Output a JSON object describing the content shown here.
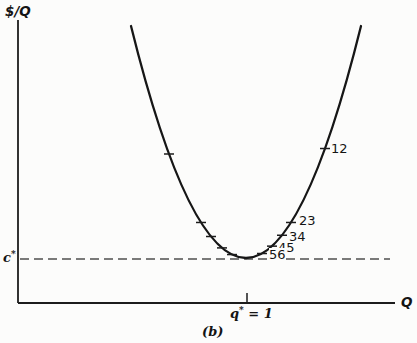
{
  "figure": {
    "y_axis_label": "$/Q",
    "x_axis_label": "Q",
    "c_star": {
      "base": "c",
      "sup": "*"
    },
    "q_star": {
      "base": "q",
      "sup": "*",
      "suffix": " = 1"
    },
    "caption": "(b)"
  },
  "chart_data": {
    "type": "line",
    "title": "",
    "xlabel": "Q",
    "ylabel": "$/Q",
    "x_axis_ticks": [
      {
        "label": "q* = 1",
        "q": 1
      }
    ],
    "y_axis_refs": [
      {
        "label": "c*",
        "meaning": "minimum average cost, dashed reference line"
      }
    ],
    "curve_range_q": {
      "min_q": 0.49,
      "max_q": 1.5,
      "vertex_q": 1.0,
      "vertex_cost": "c*"
    },
    "labeled_points": [
      {
        "label": "12",
        "q": 1.34
      },
      {
        "label": "23",
        "q": 1.19
      },
      {
        "label": "34",
        "q": 1.15
      },
      {
        "label": "45",
        "q": 1.11
      },
      {
        "label": "56",
        "q": 1.07
      }
    ],
    "unlabeled_tick_q": [
      0.66,
      0.8,
      0.84,
      0.89,
      0.93
    ],
    "legend": "none",
    "grid": "off",
    "geometry": {
      "canvas": {
        "width": 417,
        "height": 343
      },
      "axis_color": "#1c1c1c",
      "curve_color": "#161616",
      "dash_color": "#4f4f4f",
      "axis_width": 1.8,
      "tick_width": 1.5,
      "y_axis": {
        "x": 18,
        "y_top": 20,
        "y_bottom": 303
      },
      "x_axis": {
        "y": 303,
        "x_left": 18,
        "x_right": 395
      },
      "x_axis_tick": {
        "x": 247,
        "y1": 293,
        "y2": 303
      },
      "dashed_line": {
        "y": 259,
        "x1": 20,
        "x2": 390,
        "dash": "9 5",
        "width": 1.7
      },
      "curve": {
        "x0": 131,
        "x1": 361,
        "y_end": 26,
        "y_min": 258,
        "stroke_width": 2.3
      },
      "curve_tick_xs": [
        169,
        201,
        211,
        222,
        232,
        262,
        272,
        282,
        291,
        325
      ],
      "curve_tick_len": 10,
      "point_labels": [
        {
          "text": "12",
          "x": 331,
          "y": 142
        },
        {
          "text": "23",
          "x": 299,
          "y": 214
        },
        {
          "text": "34",
          "x": 289,
          "y": 230
        },
        {
          "text": "45",
          "x": 278,
          "y": 241
        },
        {
          "text": "56",
          "x": 269,
          "y": 248,
          "bg": true
        }
      ]
    }
  }
}
